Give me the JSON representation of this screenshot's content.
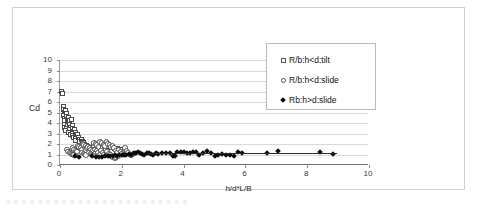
{
  "figure": {
    "background": "#ffffff",
    "frame_color": "#d2d2d2",
    "scan_artifact_text": "a  e  a    a   a  e   a      e  a  a  a  a   a    e   a  a   a   a  a  e  a  a   a"
  },
  "legend": {
    "entries": [
      {
        "marker": "hollow-square",
        "label": "R/b:h<d:tilt"
      },
      {
        "marker": "hollow-circle",
        "label": "R/b:h<d:slide"
      },
      {
        "marker": "filled-diamond",
        "label": "Rb:h>d:slide"
      }
    ]
  },
  "chart_data": {
    "type": "scatter",
    "title": "",
    "xlabel": "h/d*L/B",
    "ylabel": "Cd",
    "xlim": [
      0,
      10
    ],
    "ylim": [
      0,
      10
    ],
    "xticks": [
      0,
      2,
      4,
      6,
      8,
      10
    ],
    "xtick_labels": [
      "0",
      "2",
      "4",
      "6",
      "8",
      "10"
    ],
    "yticks": [
      0,
      1,
      2,
      3,
      4,
      5,
      6,
      7,
      8,
      9,
      10
    ],
    "ytick_labels": [
      "0",
      "1",
      "2",
      "3",
      "4",
      "5",
      "6",
      "7",
      "8",
      "9",
      "10"
    ],
    "grid": "horizontal",
    "legend_position": "top-right-inside",
    "series": [
      {
        "name": "R/b:h<d:tilt",
        "marker": "hollow-square",
        "color": "#4a4a4a",
        "points": [
          [
            0.06,
            7.0
          ],
          [
            0.07,
            6.8
          ],
          [
            0.1,
            5.6
          ],
          [
            0.12,
            5.3
          ],
          [
            0.13,
            5.0
          ],
          [
            0.11,
            4.7
          ],
          [
            0.14,
            4.4
          ],
          [
            0.16,
            4.2
          ],
          [
            0.15,
            3.9
          ],
          [
            0.13,
            3.6
          ],
          [
            0.18,
            5.2
          ],
          [
            0.2,
            4.9
          ],
          [
            0.22,
            4.6
          ],
          [
            0.24,
            4.3
          ],
          [
            0.26,
            4.1
          ],
          [
            0.23,
            3.8
          ],
          [
            0.21,
            3.5
          ],
          [
            0.19,
            3.3
          ],
          [
            0.28,
            4.5
          ],
          [
            0.3,
            4.2
          ],
          [
            0.32,
            3.9
          ],
          [
            0.34,
            3.6
          ],
          [
            0.3,
            3.4
          ],
          [
            0.28,
            3.1
          ],
          [
            0.33,
            2.9
          ],
          [
            0.38,
            4.3
          ],
          [
            0.4,
            3.8
          ],
          [
            0.42,
            3.5
          ],
          [
            0.44,
            3.2
          ],
          [
            0.41,
            3.0
          ],
          [
            0.39,
            2.8
          ],
          [
            0.45,
            2.6
          ],
          [
            0.48,
            3.4
          ],
          [
            0.5,
            3.1
          ],
          [
            0.52,
            2.9
          ],
          [
            0.54,
            2.7
          ],
          [
            0.51,
            2.5
          ],
          [
            0.49,
            2.3
          ],
          [
            0.58,
            2.9
          ],
          [
            0.6,
            2.6
          ],
          [
            0.62,
            2.4
          ],
          [
            0.64,
            2.2
          ],
          [
            0.68,
            2.4
          ],
          [
            0.72,
            2.2
          ],
          [
            0.76,
            2.1
          ],
          [
            0.8,
            2.0
          ],
          [
            0.85,
            1.9
          ],
          [
            0.9,
            1.8
          ],
          [
            0.95,
            1.7
          ],
          [
            1.1,
            1.9
          ],
          [
            1.25,
            1.8
          ],
          [
            1.35,
            1.7
          ],
          [
            1.45,
            1.9
          ],
          [
            1.55,
            1.8
          ],
          [
            1.65,
            1.7
          ],
          [
            1.75,
            1.6
          ],
          [
            1.85,
            1.6
          ],
          [
            1.95,
            1.5
          ]
        ]
      },
      {
        "name": "R/b:h<d:slide",
        "marker": "hollow-circle",
        "color": "#4a4a4a",
        "points": [
          [
            0.22,
            1.5
          ],
          [
            0.26,
            1.3
          ],
          [
            0.3,
            1.2
          ],
          [
            0.34,
            1.1
          ],
          [
            0.38,
            1.0
          ],
          [
            0.42,
            1.0
          ],
          [
            0.46,
            0.95
          ],
          [
            0.5,
            0.9
          ],
          [
            0.4,
            1.6
          ],
          [
            0.45,
            1.5
          ],
          [
            0.5,
            1.4
          ],
          [
            0.55,
            1.3
          ],
          [
            0.58,
            1.8
          ],
          [
            0.62,
            1.7
          ],
          [
            0.66,
            1.6
          ],
          [
            0.7,
            1.5
          ],
          [
            0.74,
            2.0
          ],
          [
            0.78,
            1.9
          ],
          [
            0.82,
            1.8
          ],
          [
            0.86,
            1.6
          ],
          [
            0.72,
            1.2
          ],
          [
            0.76,
            1.1
          ],
          [
            0.8,
            1.0
          ],
          [
            0.84,
            0.95
          ],
          [
            0.9,
            1.7
          ],
          [
            0.95,
            1.6
          ],
          [
            1.0,
            1.5
          ],
          [
            1.05,
            1.4
          ],
          [
            0.92,
            1.2
          ],
          [
            0.98,
            1.1
          ],
          [
            1.02,
            1.0
          ],
          [
            1.06,
            0.9
          ],
          [
            1.1,
            2.1
          ],
          [
            1.15,
            2.0
          ],
          [
            1.2,
            1.9
          ],
          [
            1.25,
            1.7
          ],
          [
            1.12,
            1.5
          ],
          [
            1.18,
            1.4
          ],
          [
            1.22,
            1.2
          ],
          [
            1.28,
            1.0
          ],
          [
            1.3,
            2.2
          ],
          [
            1.35,
            2.1
          ],
          [
            1.4,
            1.9
          ],
          [
            1.45,
            1.8
          ],
          [
            1.32,
            1.4
          ],
          [
            1.38,
            1.2
          ],
          [
            1.42,
            1.0
          ],
          [
            1.48,
            0.9
          ],
          [
            1.5,
            2.2
          ],
          [
            1.55,
            2.0
          ],
          [
            1.6,
            1.9
          ],
          [
            1.65,
            1.7
          ],
          [
            1.52,
            1.3
          ],
          [
            1.58,
            1.1
          ],
          [
            1.62,
            0.95
          ],
          [
            1.68,
            0.8
          ],
          [
            1.7,
            1.8
          ],
          [
            1.75,
            1.6
          ],
          [
            1.8,
            1.4
          ],
          [
            1.85,
            1.2
          ],
          [
            1.72,
            0.7
          ],
          [
            1.78,
            0.65
          ],
          [
            1.82,
            0.7
          ],
          [
            1.88,
            0.8
          ],
          [
            1.9,
            1.5
          ],
          [
            1.95,
            1.3
          ],
          [
            2.0,
            1.1
          ],
          [
            2.05,
            1.0
          ],
          [
            2.1,
            1.6
          ],
          [
            2.15,
            1.4
          ],
          [
            2.2,
            1.2
          ],
          [
            2.25,
            1.0
          ],
          [
            2.3,
            0.9
          ],
          [
            2.35,
            1.0
          ],
          [
            2.4,
            1.1
          ]
        ]
      },
      {
        "name": "Rb:h>d:slide",
        "marker": "filled-diamond",
        "color": "#0c0c0c",
        "points": [
          [
            0.5,
            0.85
          ],
          [
            0.62,
            0.8
          ],
          [
            1.05,
            0.85
          ],
          [
            1.15,
            0.8
          ],
          [
            1.25,
            0.78
          ],
          [
            1.35,
            0.8
          ],
          [
            1.45,
            0.85
          ],
          [
            1.55,
            0.9
          ],
          [
            1.62,
            0.88
          ],
          [
            1.7,
            0.9
          ],
          [
            1.78,
            0.95
          ],
          [
            1.85,
            0.9
          ],
          [
            1.92,
            0.95
          ],
          [
            2.0,
            1.0
          ],
          [
            2.08,
            0.95
          ],
          [
            2.15,
            1.0
          ],
          [
            2.22,
            1.05
          ],
          [
            2.3,
            1.0
          ],
          [
            2.38,
            1.1
          ],
          [
            2.45,
            1.15
          ],
          [
            2.52,
            1.2
          ],
          [
            2.58,
            1.1
          ],
          [
            2.65,
            1.05
          ],
          [
            2.72,
            1.0
          ],
          [
            2.8,
            1.1
          ],
          [
            2.88,
            1.15
          ],
          [
            2.95,
            1.05
          ],
          [
            3.02,
            1.0
          ],
          [
            3.1,
            1.1
          ],
          [
            3.18,
            1.05
          ],
          [
            3.3,
            1.1
          ],
          [
            3.42,
            1.15
          ],
          [
            3.55,
            1.1
          ],
          [
            3.65,
            0.85
          ],
          [
            3.72,
            0.9
          ],
          [
            3.8,
            1.2
          ],
          [
            3.9,
            1.25
          ],
          [
            4.0,
            1.2
          ],
          [
            4.1,
            1.1
          ],
          [
            4.2,
            1.15
          ],
          [
            4.3,
            1.25
          ],
          [
            4.4,
            1.2
          ],
          [
            4.5,
            0.95
          ],
          [
            4.62,
            1.1
          ],
          [
            4.75,
            1.35
          ],
          [
            4.88,
            1.1
          ],
          [
            5.0,
            0.9
          ],
          [
            5.12,
            0.95
          ],
          [
            5.25,
            1.05
          ],
          [
            5.38,
            1.0
          ],
          [
            5.5,
            0.95
          ],
          [
            5.62,
            0.9
          ],
          [
            5.75,
            1.2
          ],
          [
            5.9,
            1.1
          ],
          [
            6.7,
            1.1
          ],
          [
            7.05,
            1.35
          ],
          [
            8.4,
            1.2
          ],
          [
            8.85,
            1.05
          ]
        ]
      }
    ],
    "trendline": {
      "series": "Rb:h>d:slide",
      "x_start": 2.85,
      "x_end": 8.95,
      "y": 1.1,
      "color": "#2b2b2b"
    }
  }
}
